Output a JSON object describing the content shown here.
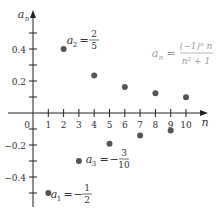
{
  "chart_data": {
    "type": "scatter",
    "title": "",
    "xlabel": "n",
    "ylabel": "a_n",
    "formula": {
      "lhs": "a",
      "lhs_sub": "n",
      "eq": "=",
      "numerator": "(−1)ⁿ n",
      "denominator": "n² + 1"
    },
    "x_ticks": [
      1,
      2,
      3,
      4,
      5,
      6,
      7,
      8,
      9,
      10
    ],
    "x_tick_labels": [
      "1",
      "2",
      "3",
      "4",
      "5",
      "6",
      "7",
      "8",
      "9",
      "10"
    ],
    "origin_label": "0",
    "y_tick_labels": [
      {
        "value": 0.4,
        "label": "0.4"
      },
      {
        "value": 0.2,
        "label": "0.2"
      },
      {
        "value": -0.2,
        "label": "−0.2"
      },
      {
        "value": -0.4,
        "label": "−0.4"
      }
    ],
    "y_minor_ticks": [
      0.5,
      0.3,
      0.1,
      -0.1,
      -0.3,
      -0.5
    ],
    "xlim": [
      0,
      11
    ],
    "ylim": [
      -0.6,
      0.6
    ],
    "grid": false,
    "points": [
      {
        "n": 1,
        "a": -0.5
      },
      {
        "n": 2,
        "a": 0.4
      },
      {
        "n": 3,
        "a": -0.3
      },
      {
        "n": 4,
        "a": 0.235
      },
      {
        "n": 5,
        "a": -0.192
      },
      {
        "n": 6,
        "a": 0.162
      },
      {
        "n": 7,
        "a": -0.14
      },
      {
        "n": 8,
        "a": 0.123
      },
      {
        "n": 9,
        "a": -0.11
      },
      {
        "n": 10,
        "a": 0.099
      }
    ],
    "annotations": [
      {
        "text": "a",
        "sub": "2",
        "value_num": "2",
        "value_den": "5",
        "sign": "",
        "near_n": 2
      },
      {
        "text": "a",
        "sub": "3",
        "value_num": "3",
        "value_den": "10",
        "sign": "−",
        "near_n": 3
      },
      {
        "text": "a",
        "sub": "1",
        "value_num": "1",
        "value_den": "2",
        "sign": "−",
        "near_n": 1
      }
    ],
    "colors": {
      "axis": "#222222",
      "point": "#555555",
      "formula": "#9a9a9a",
      "text": "#333333"
    }
  }
}
